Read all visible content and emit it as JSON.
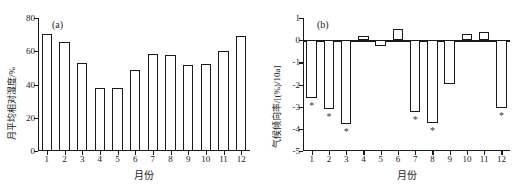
{
  "figure": {
    "panels": [
      {
        "tag": "(a)",
        "xlabel": "月份",
        "ylabel": "月平均相对湿度/%"
      },
      {
        "tag": "(b)",
        "xlabel": "月份",
        "ylabel": "气候倾向率/[(%)/10a]"
      }
    ]
  },
  "chart_data": [
    {
      "type": "bar",
      "title": "(a)",
      "xlabel": "月份",
      "ylabel": "月平均相对湿度/%",
      "categories": [
        "1",
        "2",
        "3",
        "4",
        "5",
        "6",
        "7",
        "8",
        "9",
        "10",
        "11",
        "12"
      ],
      "values": [
        70.5,
        65.5,
        53.0,
        38.0,
        38.0,
        49.0,
        58.5,
        57.5,
        52.0,
        52.5,
        60.0,
        69.0
      ],
      "ylim": [
        0,
        80
      ],
      "yticks": [
        0,
        20,
        40,
        60,
        80
      ],
      "ytick_labels": [
        "0",
        "20",
        "40",
        "60",
        "80"
      ],
      "grid": false,
      "legend": false
    },
    {
      "type": "bar",
      "title": "(b)",
      "xlabel": "月份",
      "ylabel": "气候倾向率/[(%)/10a]",
      "categories": [
        "1",
        "2",
        "3",
        "4",
        "5",
        "6",
        "7",
        "8",
        "9",
        "10",
        "11",
        "12"
      ],
      "values": [
        -2.6,
        -3.1,
        -3.8,
        0.2,
        -0.25,
        0.5,
        -3.25,
        -3.75,
        -2.0,
        0.3,
        0.35,
        -3.05
      ],
      "annotations": [
        {
          "category": "1",
          "marker": "*"
        },
        {
          "category": "2",
          "marker": "*"
        },
        {
          "category": "3",
          "marker": "*"
        },
        {
          "category": "7",
          "marker": "*"
        },
        {
          "category": "8",
          "marker": "*"
        },
        {
          "category": "12",
          "marker": "*"
        }
      ],
      "ylim": [
        -5,
        1
      ],
      "yticks": [
        1,
        0,
        -1,
        -2,
        -3,
        -4,
        -5
      ],
      "ytick_labels": [
        "1",
        "0",
        "-1",
        "-2",
        "-3",
        "-4",
        "-5"
      ],
      "grid": false,
      "legend": false
    }
  ]
}
